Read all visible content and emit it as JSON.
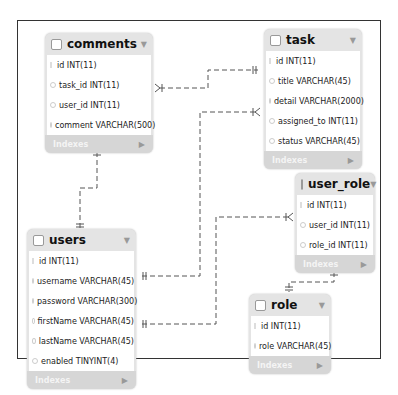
{
  "diagram": {
    "type": "ER diagram",
    "entities": [
      {
        "name": "comments",
        "columns": [
          "id INT(11)",
          "task_id INT(11)",
          "user_id INT(11)",
          "comment VARCHAR(500)"
        ],
        "footer": "Indexes"
      },
      {
        "name": "task",
        "columns": [
          "id INT(11)",
          "title VARCHAR(45)",
          "detail VARCHAR(2000)",
          "assigned_to INT(11)",
          "status VARCHAR(45)"
        ],
        "footer": "Indexes"
      },
      {
        "name": "user_role",
        "columns": [
          "id INT(11)",
          "user_id INT(11)",
          "role_id INT(11)"
        ],
        "footer": "Indexes"
      },
      {
        "name": "users",
        "columns": [
          "id INT(11)",
          "username VARCHAR(45)",
          "password VARCHAR(300)",
          "firstName VARCHAR(45)",
          "lastName VARCHAR(45)",
          "enabled TINYINT(4)"
        ],
        "footer": "Indexes"
      },
      {
        "name": "role",
        "columns": [
          "id INT(11)",
          "role VARCHAR(45)"
        ],
        "footer": "Indexes"
      }
    ],
    "relationships": [
      {
        "from": "comments.task_id",
        "to": "task.id",
        "type": "many-to-one"
      },
      {
        "from": "comments.user_id",
        "to": "users.id",
        "type": "many-to-one"
      },
      {
        "from": "task.assigned_to",
        "to": "users.username",
        "type": "many-to-one"
      },
      {
        "from": "user_role.user_id",
        "to": "users.lastName",
        "type": "many-to-one"
      },
      {
        "from": "user_role.role_id",
        "to": "role.id",
        "type": "many-to-one"
      }
    ]
  }
}
